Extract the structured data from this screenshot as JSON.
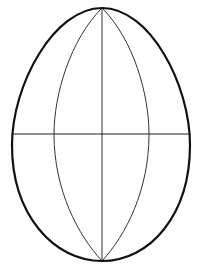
{
  "diagram": {
    "title": "",
    "colors": {
      "background": "#ffffff",
      "outline": "#111111",
      "inner_lines": "#333333"
    },
    "shape": {
      "type": "egg",
      "top": [
        102,
        8
      ],
      "bottom": [
        102,
        261
      ],
      "left": [
        12,
        145
      ],
      "right": [
        190,
        145
      ]
    },
    "lines": [
      {
        "name": "vertical-axis",
        "from": [
          102,
          8
        ],
        "to": [
          102,
          261
        ]
      },
      {
        "name": "equator",
        "from": [
          12,
          134
        ],
        "to": [
          190,
          134
        ]
      },
      {
        "name": "left-meridian",
        "through_x_at_equator": 54
      },
      {
        "name": "right-meridian",
        "through_x_at_equator": 149
      }
    ]
  }
}
